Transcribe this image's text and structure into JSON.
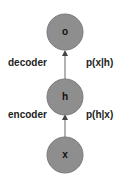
{
  "nodes": {
    "output": {
      "label": "o"
    },
    "hidden": {
      "label": "h"
    },
    "input": {
      "label": "x"
    }
  },
  "edges": {
    "decoder": {
      "name": "decoder",
      "prob": "p(x|h)"
    },
    "encoder": {
      "name": "encoder",
      "prob": "p(h|x)"
    }
  },
  "colors": {
    "node_fill": "#8e8e8e",
    "node_stroke": "#7a7a7a",
    "arrow": "#444444"
  }
}
